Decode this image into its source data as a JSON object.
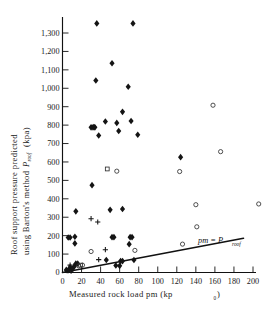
{
  "chart_data": {
    "type": "scatter",
    "title": "",
    "xlabel": "Measured rock load pm (kp₀)",
    "ylabel": "Roof support pressure predicted using Barton's method Pᵣₒₒf (kpa)",
    "ylabel_line1": "Roof support pressure predicted",
    "ylabel_line2_a": "using Barton's method",
    "ylabel_line2_b": "P",
    "ylabel_line2_sub": "roof",
    "ylabel_line2_c": "(kpa)",
    "xlabel_main": "Measured rock load pm (kp",
    "xlabel_sub": "0",
    "xlabel_tail": ")",
    "xlim": [
      0,
      200
    ],
    "ylim": [
      0,
      1360
    ],
    "xticks": [
      0,
      20,
      40,
      60,
      80,
      100,
      120,
      140,
      160,
      180,
      200
    ],
    "xtick_labels": [
      "0",
      "20",
      "40",
      "60",
      "80",
      "100",
      "120",
      "140",
      "160",
      "180",
      "200"
    ],
    "yticks": [
      0,
      100,
      200,
      300,
      400,
      500,
      600,
      700,
      800,
      900,
      1000,
      1100,
      1200,
      1300
    ],
    "ytick_labels": [
      "0",
      "100",
      "200",
      "300",
      "400",
      "500",
      "600",
      "700",
      "800",
      "900",
      "1,000",
      "1,100",
      "1,200",
      "1,300"
    ],
    "grid": false,
    "legend": "none",
    "annotations": [
      {
        "text": "pm = P",
        "subscript": "roof",
        "x": 150,
        "y": 215,
        "style": "italic"
      }
    ],
    "reference_line": {
      "label": "pm = P roof",
      "equation": "y = x",
      "x_start": 0,
      "y_start": 0,
      "x_end": 190,
      "y_end": 186
    },
    "series": [
      {
        "name": "filled-diamond",
        "marker": "diamond-filled",
        "points": [
          [
            36,
            1352
          ],
          [
            74,
            1352
          ],
          [
            52,
            1136
          ],
          [
            35,
            1042
          ],
          [
            69,
            1008
          ],
          [
            63,
            872
          ],
          [
            45,
            820
          ],
          [
            72,
            822
          ],
          [
            30,
            788
          ],
          [
            32,
            788
          ],
          [
            34,
            788
          ],
          [
            33,
            790
          ],
          [
            57,
            812
          ],
          [
            59,
            768
          ],
          [
            38,
            744
          ],
          [
            79,
            748
          ],
          [
            124,
            626
          ],
          [
            31,
            474
          ],
          [
            50,
            340
          ],
          [
            63,
            345
          ],
          [
            14,
            332
          ],
          [
            6,
            190
          ],
          [
            8,
            190
          ],
          [
            52,
            192
          ],
          [
            54,
            192
          ],
          [
            71,
            192
          ],
          [
            73,
            192
          ],
          [
            13,
            194
          ],
          [
            13,
            158
          ],
          [
            70,
            154
          ],
          [
            46,
            68
          ],
          [
            61,
            62
          ],
          [
            63,
            62
          ],
          [
            75,
            68
          ],
          [
            56,
            38
          ],
          [
            60,
            36
          ],
          [
            8,
            28
          ],
          [
            12,
            30
          ],
          [
            14,
            48
          ],
          [
            16,
            48
          ],
          [
            4,
            14
          ],
          [
            6,
            12
          ],
          [
            10,
            18
          ]
        ]
      },
      {
        "name": "open-circle",
        "marker": "circle-open",
        "points": [
          [
            158,
            908
          ],
          [
            166,
            656
          ],
          [
            123,
            548
          ],
          [
            57,
            550
          ],
          [
            206,
            372
          ],
          [
            140,
            368
          ],
          [
            141,
            248
          ],
          [
            126,
            154
          ],
          [
            76,
            120
          ],
          [
            30,
            114
          ],
          [
            21,
            40
          ],
          [
            17,
            36
          ]
        ]
      },
      {
        "name": "open-square",
        "marker": "square-open",
        "points": [
          [
            47,
            562
          ],
          [
            19,
            40
          ]
        ]
      },
      {
        "name": "plus",
        "marker": "plus",
        "points": [
          [
            30,
            292
          ],
          [
            37,
            274
          ],
          [
            45,
            124
          ],
          [
            38,
            70
          ],
          [
            8,
            40
          ],
          [
            14,
            44
          ],
          [
            5,
            10
          ],
          [
            9,
            8
          ]
        ]
      }
    ]
  }
}
